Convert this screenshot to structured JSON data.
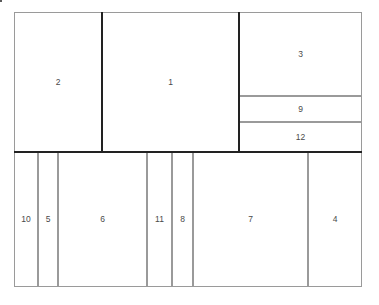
{
  "figure": {
    "type": "rectangle-packing-diagram",
    "background_color": "#ffffff",
    "frame_color": "#5a5a5a",
    "separator_color": "#222222",
    "cell_border_color": "#9a9a9a",
    "label_color": "#4a4a4a",
    "frame": {
      "x": 14,
      "y": 12,
      "width": 348,
      "height": 275
    },
    "caption": ""
  },
  "rows": {
    "top": {
      "y": 12,
      "height": 140
    },
    "bottom": {
      "y": 152,
      "height": 135
    }
  },
  "cells": [
    {
      "label": "2",
      "x": 14,
      "y": 12,
      "width": 88,
      "height": 140
    },
    {
      "label": "1",
      "x": 102,
      "y": 12,
      "width": 137,
      "height": 140
    },
    {
      "label": "3",
      "x": 239,
      "y": 12,
      "width": 123,
      "height": 84
    },
    {
      "label": "9",
      "x": 239,
      "y": 96,
      "width": 123,
      "height": 26
    },
    {
      "label": "12",
      "x": 239,
      "y": 122,
      "width": 123,
      "height": 30
    },
    {
      "label": "10",
      "x": 14,
      "y": 152,
      "width": 24,
      "height": 135
    },
    {
      "label": "5",
      "x": 38,
      "y": 152,
      "width": 20,
      "height": 135
    },
    {
      "label": "6",
      "x": 58,
      "y": 152,
      "width": 89,
      "height": 135
    },
    {
      "label": "11",
      "x": 147,
      "y": 152,
      "width": 25,
      "height": 135
    },
    {
      "label": "8",
      "x": 172,
      "y": 152,
      "width": 21,
      "height": 135
    },
    {
      "label": "7",
      "x": 193,
      "y": 152,
      "width": 115,
      "height": 135
    },
    {
      "label": "4",
      "x": 308,
      "y": 152,
      "width": 54,
      "height": 135
    }
  ],
  "separators": [
    {
      "name": "main-horizontal-separator",
      "orientation": "h",
      "x": 14,
      "y": 151,
      "length": 348
    },
    {
      "name": "separator-2-1",
      "orientation": "v",
      "x": 101,
      "y": 12,
      "length": 140
    },
    {
      "name": "separator-1-3",
      "orientation": "v",
      "x": 238,
      "y": 12,
      "length": 140
    }
  ]
}
